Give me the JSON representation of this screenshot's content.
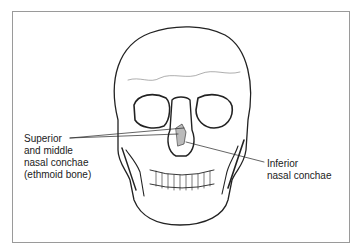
{
  "figure": {
    "labels": [
      {
        "id": "superior-middle",
        "lines": [
          "Superior",
          "and middle",
          "nasal conchae",
          "(ethmoid bone)"
        ]
      },
      {
        "id": "inferior",
        "lines": [
          "Inferior",
          "nasal conchae"
        ]
      }
    ],
    "colors": {
      "frame": "#9a9a9a",
      "ink": "#222222",
      "background": "#ffffff"
    }
  }
}
